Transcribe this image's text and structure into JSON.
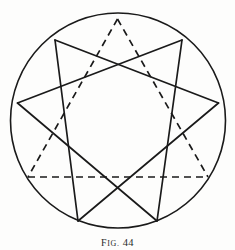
{
  "figure": {
    "caption_prefix_first": "F",
    "caption_prefix_rest": "IG.",
    "caption_number": "44",
    "caption_full": "FIG. 44",
    "background_color": "#fdfdfc",
    "ink_color": "#1a1a1a",
    "circle": {
      "name": "enclosing-circle",
      "cx": 118,
      "cy": 120.5,
      "r": 107.5,
      "stroke_width": 1.6,
      "style": "solid"
    },
    "points": [
      {
        "id": "p1",
        "label": "top",
        "x": 117.5,
        "y": 19.0
      },
      {
        "id": "p2",
        "label": "upper-left",
        "x": 55.0,
        "y": 40.0
      },
      {
        "id": "p3",
        "label": "upper-right",
        "x": 182.0,
        "y": 40.0
      },
      {
        "id": "p4",
        "label": "left",
        "x": 17.5,
        "y": 103.0
      },
      {
        "id": "p5",
        "label": "right",
        "x": 218.5,
        "y": 103.0
      },
      {
        "id": "p6",
        "label": "lower-left",
        "x": 28.0,
        "y": 177.0
      },
      {
        "id": "p7",
        "label": "lower-right",
        "x": 208.0,
        "y": 177.0
      },
      {
        "id": "p8",
        "label": "bottom-left",
        "x": 78.0,
        "y": 221.0
      },
      {
        "id": "p9",
        "label": "bottom-right",
        "x": 157.0,
        "y": 221.0
      }
    ],
    "solid_star": {
      "name": "solid-star-polygon",
      "style": "solid",
      "stroke_width": 1.7,
      "edges": [
        {
          "from": "p2",
          "to": "p5"
        },
        {
          "from": "p5",
          "to": "p8"
        },
        {
          "from": "p8",
          "to": "p2"
        },
        {
          "from": "p3",
          "to": "p4"
        },
        {
          "from": "p4",
          "to": "p9"
        },
        {
          "from": "p9",
          "to": "p3"
        }
      ]
    },
    "dashed_triangle": {
      "name": "dashed-triangle",
      "style": "dashed",
      "stroke_width": 1.7,
      "dash_pattern": "7,5",
      "edges": [
        {
          "from": "p1",
          "to": "p6"
        },
        {
          "from": "p1",
          "to": "p7"
        },
        {
          "from": "p6",
          "to": "p7"
        }
      ]
    }
  }
}
